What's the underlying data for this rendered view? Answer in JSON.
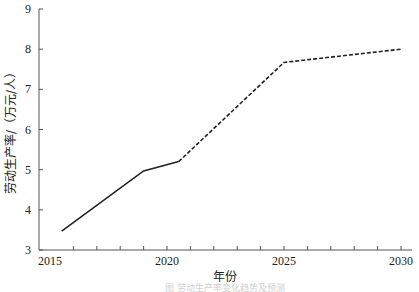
{
  "chart_data": {
    "type": "line",
    "title": "",
    "xlabel": "年份",
    "ylabel": "劳动生产率/（万元/人）",
    "xlim": [
      2015,
      2030
    ],
    "ylim": [
      3,
      9
    ],
    "x_ticks": [
      2015,
      2020,
      2025,
      2030
    ],
    "x_minor_tick_step": 1,
    "y_ticks": [
      3,
      4,
      5,
      6,
      7,
      8,
      9
    ],
    "grid": false,
    "legend": null,
    "series": [
      {
        "name": "实际值",
        "style": "solid",
        "points": [
          {
            "x": 2015.5,
            "y": 3.47
          },
          {
            "x": 2019,
            "y": 4.97
          },
          {
            "x": 2020.5,
            "y": 5.2
          }
        ]
      },
      {
        "name": "预测值",
        "style": "dashed",
        "points": [
          {
            "x": 2020.5,
            "y": 5.2
          },
          {
            "x": 2025,
            "y": 7.67
          },
          {
            "x": 2030,
            "y": 8.0
          }
        ]
      }
    ],
    "line_color": "#222222"
  },
  "caption": "图  劳动生产率变化趋势及预测"
}
